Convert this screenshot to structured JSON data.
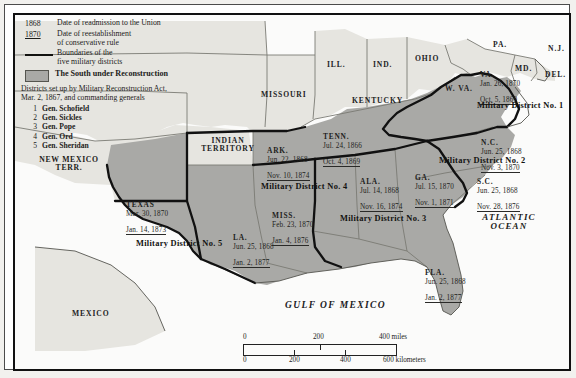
{
  "legend": {
    "readmission": {
      "year": "1868",
      "text": "Date of readmission to the Union"
    },
    "conservative": {
      "year": "1870",
      "text_l1": "Date of reestablishment",
      "text_l2": "of conservative rule"
    },
    "boundaries": {
      "text_l1": "Boundaries of the",
      "text_l2": "five military districts"
    },
    "shaded": {
      "text": "The South under Reconstruction"
    },
    "note_l1": "Districts set up by Military Reconstruction Act,",
    "note_l2": "Mar. 2, 1867, and commanding generals",
    "generals": [
      {
        "num": "1",
        "name": "Gen. Schofield"
      },
      {
        "num": "2",
        "name": "Gen. Sickles"
      },
      {
        "num": "3",
        "name": "Gen. Pope"
      },
      {
        "num": "4",
        "name": "Gen. Ord"
      },
      {
        "num": "5",
        "name": "Gen. Sheridan"
      }
    ]
  },
  "territory_labels": {
    "new_mexico_l1": "NEW MEXICO",
    "new_mexico_l2": "TERR.",
    "indian_l1": "INDIAN",
    "indian_l2": "TERRITORY",
    "missouri": "MISSOURI",
    "illinois": "ILL.",
    "indiana": "IND.",
    "ohio": "OHIO",
    "pennsylvania": "PA.",
    "new_jersey": "N.J.",
    "maryland": "MD.",
    "delaware": "DEL.",
    "west_virginia": "W. VA.",
    "kentucky": "KENTUCKY",
    "mexico": "MEXICO",
    "gulf": "GULF OF MEXICO",
    "atlantic_l1": "ATLANTIC",
    "atlantic_l2": "OCEAN"
  },
  "states": [
    {
      "id": "texas",
      "name": "TEXAS",
      "readmitted": "Mar. 30, 1870",
      "conservative": "Jan. 14, 1873"
    },
    {
      "id": "arkansas",
      "name": "ARK.",
      "readmitted": "Jun. 22, 1868",
      "conservative": "Nov. 10, 1874"
    },
    {
      "id": "louisiana",
      "name": "LA.",
      "readmitted": "Jun. 25, 1868",
      "conservative": "Jan. 2, 1877"
    },
    {
      "id": "mississippi",
      "name": "MISS.",
      "readmitted": "Feb. 23, 1870",
      "conservative": "Jan. 4, 1876"
    },
    {
      "id": "tennessee",
      "name": "TENN.",
      "readmitted": "Jul. 24, 1866",
      "conservative": "Oct. 4, 1869"
    },
    {
      "id": "alabama",
      "name": "ALA.",
      "readmitted": "Jul. 14, 1868",
      "conservative": "Nov. 16, 1874"
    },
    {
      "id": "georgia",
      "name": "GA.",
      "readmitted": "Jul. 15, 1870",
      "conservative": "Nov. 1, 1871"
    },
    {
      "id": "florida",
      "name": "FLA.",
      "readmitted": "Jun. 25, 1868",
      "conservative": "Jan. 2, 1877"
    },
    {
      "id": "south-carolina",
      "name": "S.C.",
      "readmitted": "Jun. 25, 1868",
      "conservative": "Nov. 28, 1876"
    },
    {
      "id": "north-carolina",
      "name": "N.C.",
      "readmitted": "Jun. 25, 1868",
      "conservative": "Nov. 3, 1870"
    },
    {
      "id": "virginia",
      "name": "VA.",
      "readmitted": "Jan. 26, 1870",
      "conservative": "Oct. 5, 1869"
    }
  ],
  "districts": [
    {
      "id": "1",
      "label": "Military District No. 1"
    },
    {
      "id": "2",
      "label": "Military District No. 2"
    },
    {
      "id": "3",
      "label": "Military District No. 3"
    },
    {
      "id": "4",
      "label": "Military District No. 4"
    },
    {
      "id": "5",
      "label": "Military District No. 5"
    }
  ],
  "scale": {
    "miles": {
      "t0": "0",
      "t1": "200",
      "t2": "400 miles"
    },
    "kilometers": {
      "t0": "0",
      "t1": "200",
      "t2": "400",
      "t3": "600 kilometers"
    }
  },
  "colors": {
    "reconstruction_fill": "#a9a9a6",
    "other_land_fill": "#e6e5e0",
    "water_fill": "#fbfbfa",
    "district_boundary": "#111111",
    "state_boundary": "#6d6d68",
    "text": "#1e1e1c"
  }
}
